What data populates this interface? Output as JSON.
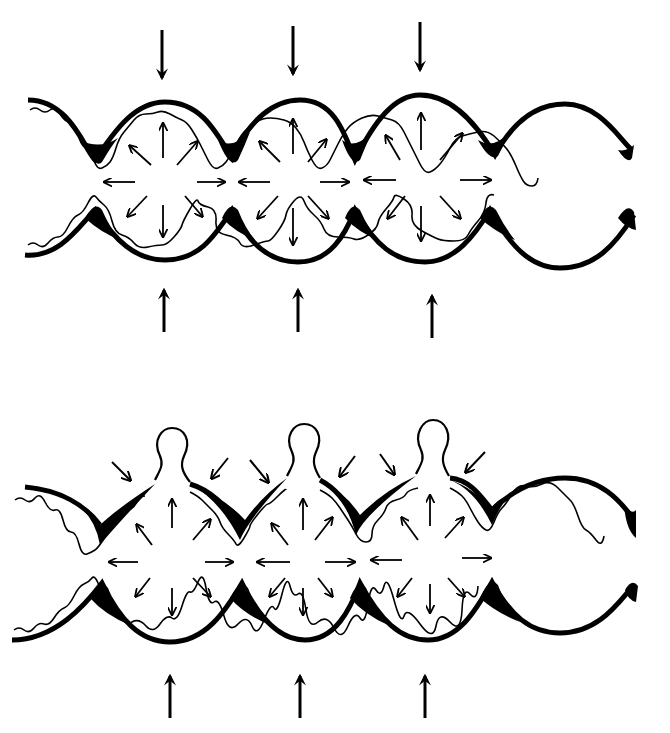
{
  "diagram": {
    "type": "anatomical-line-drawing",
    "panels": [
      {
        "id": "top",
        "description": "Tube compressed from above and below; pressure within pouches radiating outward",
        "external_arrows": {
          "top_count": 3,
          "bottom_count": 3,
          "direction": "inward"
        },
        "pouches": 4,
        "pressurized_pouches": 3
      },
      {
        "id": "bottom",
        "description": "Same tube with mucosal herniations (diverticula) protruding through the wall between muscle bands",
        "external_arrows": {
          "top_count": 0,
          "bottom_count": 3,
          "direction": "inward"
        },
        "diverticula": 3,
        "pouches": 4,
        "pressurized_pouches": 3
      }
    ],
    "colors": {
      "ink": "#000000",
      "background": "#ffffff"
    }
  }
}
